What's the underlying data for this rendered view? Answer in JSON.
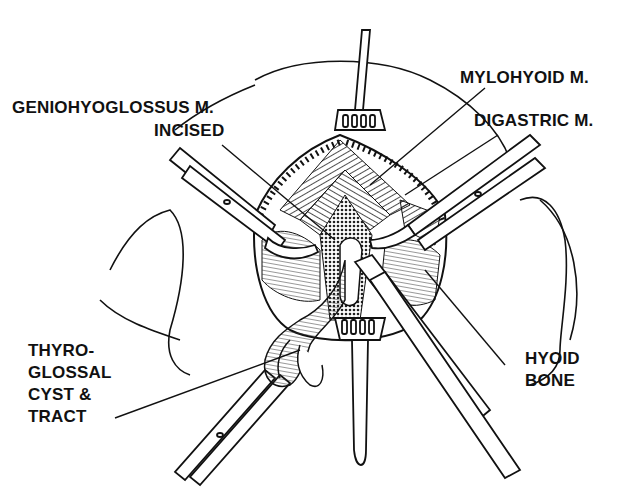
{
  "figure": {
    "labels": {
      "geniohyoglossus": {
        "line1": "GENIOHYOGLOSSUS M.",
        "line2": "INCISED"
      },
      "mylohyoid": "MYLOHYOID M.",
      "digastric": "DIGASTRIC M.",
      "thyroglossal": {
        "line1": "THYRO-",
        "line2": "GLOSSAL",
        "line3": "CYST &",
        "line4": "TRACT"
      },
      "hyoid": {
        "line1": "HYOID",
        "line2": "BONE"
      }
    },
    "colors": {
      "ink": "#111111",
      "background": "#ffffff",
      "shade": "#555555"
    }
  }
}
